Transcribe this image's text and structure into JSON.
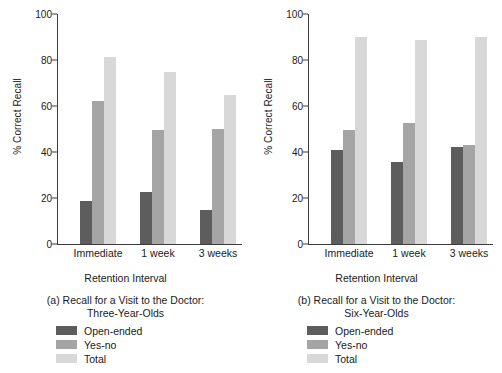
{
  "figure": {
    "panels": [
      "a",
      "b"
    ]
  },
  "chart_data": [
    {
      "type": "bar",
      "title": "(a) Recall for a Visit to the Doctor:",
      "subtitle": "Three-Year-Olds",
      "caption_line1": "(a) Recall for a Visit to the Doctor:",
      "caption_line2": "Three-Year-Olds",
      "xlabel": "Retention Interval",
      "ylabel": "% Correct Recall",
      "categories": [
        "Immediate",
        "1 week",
        "3 weeks"
      ],
      "series": [
        {
          "name": "Open-ended",
          "color": "#5d5d5d",
          "values": [
            18.5,
            22.5,
            15
          ]
        },
        {
          "name": "Yes-no",
          "color": "#a5a5a5",
          "values": [
            62,
            49.5,
            50
          ]
        },
        {
          "name": "Total",
          "color": "#d8d8d8",
          "values": [
            81.5,
            75,
            65
          ]
        }
      ],
      "ylim": [
        0,
        100
      ],
      "yticks": [
        0,
        20,
        40,
        60,
        80,
        100
      ],
      "ytick_labels": [
        "0",
        "20",
        "40",
        "60",
        "80",
        "100"
      ],
      "grid": false,
      "legend_position": "below-left"
    },
    {
      "type": "bar",
      "title": "(b) Recall for a Visit to the Doctor:",
      "subtitle": "Six-Year-Olds",
      "caption_line1": "(b) Recall for a Visit to the Doctor:",
      "caption_line2": "Six-Year-Olds",
      "xlabel": "Retention Interval",
      "ylabel": "% Correct Recall",
      "categories": [
        "Immediate",
        "1 week",
        "3 weeks"
      ],
      "series": [
        {
          "name": "Open-ended",
          "color": "#5d5d5d",
          "values": [
            41,
            35.5,
            42
          ]
        },
        {
          "name": "Yes-no",
          "color": "#a5a5a5",
          "values": [
            49.5,
            52.5,
            43
          ]
        },
        {
          "name": "Total",
          "color": "#d8d8d8",
          "values": [
            90,
            88.5,
            90
          ]
        }
      ],
      "ylim": [
        0,
        100
      ],
      "yticks": [
        0,
        20,
        40,
        60,
        80,
        100
      ],
      "ytick_labels": [
        "0",
        "20",
        "40",
        "60",
        "80",
        "100"
      ],
      "grid": false,
      "legend_position": "below-left"
    }
  ],
  "colors": {
    "open_ended": "#5d5d5d",
    "yes_no": "#a5a5a5",
    "total": "#d8d8d8",
    "axis": "#3c3c3c",
    "background": "#ffffff",
    "text": "#1a1a1a"
  }
}
